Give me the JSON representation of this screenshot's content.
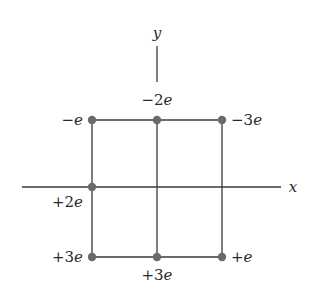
{
  "diagram": {
    "type": "charge-configuration",
    "axes": {
      "x_label": "x",
      "y_label": "y"
    },
    "grid": {
      "rows": 2,
      "cols": 2,
      "description": "2x2 square grid of 8 point charges; x-axis passes through left-middle point"
    },
    "charges": [
      {
        "id": "top-left",
        "sign": "−",
        "magnitude": "",
        "label": "−e",
        "position": [
          0,
          2
        ]
      },
      {
        "id": "top-middle",
        "sign": "−",
        "magnitude": "2",
        "label": "−2e",
        "position": [
          1,
          2
        ]
      },
      {
        "id": "top-right",
        "sign": "−",
        "magnitude": "3",
        "label": "−3e",
        "position": [
          2,
          2
        ]
      },
      {
        "id": "middle-left",
        "sign": "+",
        "magnitude": "2",
        "label": "+2e",
        "position": [
          0,
          1
        ]
      },
      {
        "id": "bottom-left",
        "sign": "+",
        "magnitude": "3",
        "label": "+3e",
        "position": [
          0,
          0
        ]
      },
      {
        "id": "bottom-middle",
        "sign": "+",
        "magnitude": "3",
        "label": "+3e",
        "position": [
          1,
          0
        ]
      },
      {
        "id": "bottom-right",
        "sign": "+",
        "magnitude": "",
        "label": "+e",
        "position": [
          2,
          0
        ]
      }
    ],
    "labels": {
      "top_left": {
        "prefix": "−",
        "unit": "e"
      },
      "top_middle": {
        "prefix": "−2",
        "unit": "e"
      },
      "top_right": {
        "prefix": "−3",
        "unit": "e"
      },
      "middle_left": {
        "prefix": "+2",
        "unit": "e"
      },
      "bottom_left": {
        "prefix": "+3",
        "unit": "e"
      },
      "bottom_middle": {
        "prefix": "+3",
        "unit": "e"
      },
      "bottom_right": {
        "prefix": "+",
        "unit": "e"
      }
    },
    "colors": {
      "line": "#3a3a3a",
      "dot": "#6a6a6a",
      "text": "#2a2a2a",
      "background": "#ffffff"
    }
  }
}
